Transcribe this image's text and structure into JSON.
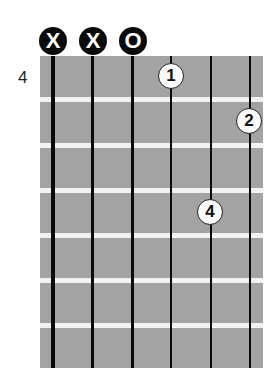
{
  "diagram": {
    "type": "guitar-chord-chart",
    "starting_fret_label": "4",
    "strings": 6,
    "frets_shown": 7,
    "string_markers": [
      {
        "string": 6,
        "label": "X"
      },
      {
        "string": 5,
        "label": "X"
      },
      {
        "string": 4,
        "label": "O"
      }
    ],
    "fingers": [
      {
        "string": 3,
        "fret": 1,
        "label": "1"
      },
      {
        "string": 1,
        "fret": 2,
        "label": "2"
      },
      {
        "string": 2,
        "fret": 4,
        "label": "4"
      }
    ],
    "colors": {
      "fretboard": "#a3a3a3",
      "fret_line": "#f2f2f2",
      "string": "#0a0a0a",
      "marker_bg": "#0a0a0a",
      "finger_bg": "#fafafa"
    }
  }
}
